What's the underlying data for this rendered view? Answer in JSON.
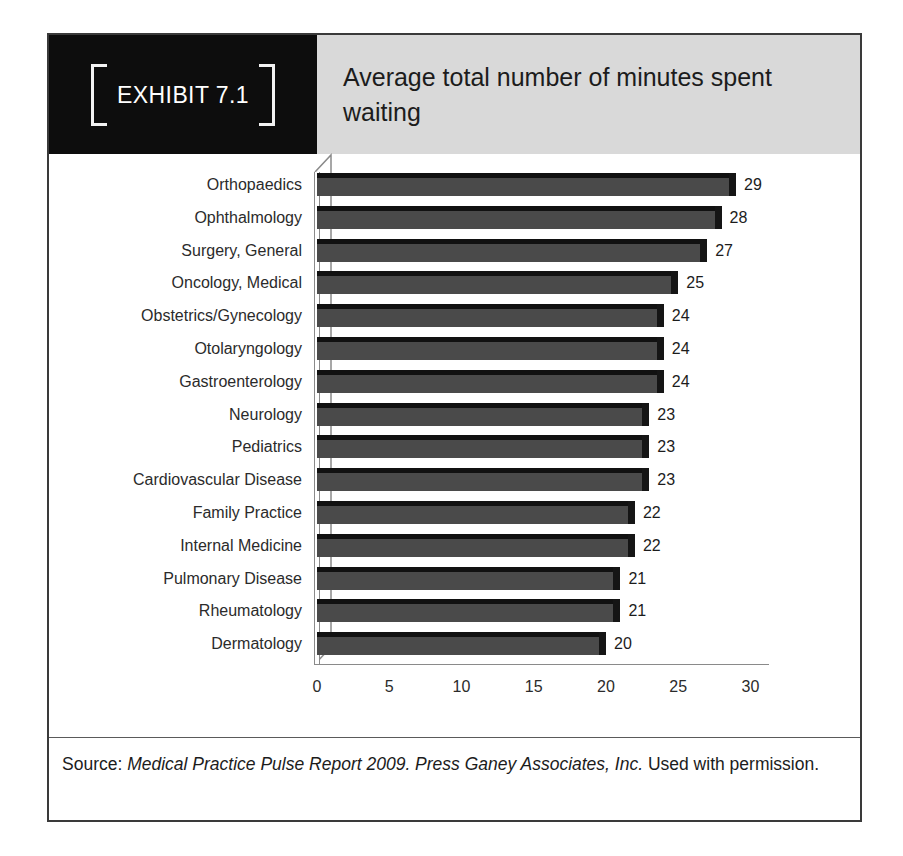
{
  "exhibit": {
    "badge_label": "EXHIBIT 7.1",
    "title": "Average total number of minutes spent waiting",
    "source_prefix": "Source: ",
    "source_italic": "Medical Practice Pulse Report 2009. Press Ganey Associates, Inc.",
    "source_suffix": " Used with permission.",
    "frame_color": "#3a3a3a",
    "badge_background": "#0d0d0d",
    "title_background": "#d9d9d9"
  },
  "chart_data": {
    "type": "bar",
    "orientation": "horizontal",
    "title": "Average total number of minutes spent waiting",
    "xlabel": "",
    "ylabel": "",
    "xlim": [
      0,
      30
    ],
    "xticks": [
      0,
      5,
      10,
      15,
      20,
      25,
      30
    ],
    "xtick_labels": [
      "0",
      "5",
      "10",
      "15",
      "20",
      "25",
      "30"
    ],
    "grid": false,
    "legend": false,
    "bar_color": "#4a4a4a",
    "bar_shade_color": "#111111",
    "data_labels": true,
    "style": "3d-bar",
    "categories": [
      "Orthopaedics",
      "Ophthalmology",
      "Surgery, General",
      "Oncology, Medical",
      "Obstetrics/Gynecology",
      "Otolaryngology",
      "Gastroenterology",
      "Neurology",
      "Pediatrics",
      "Cardiovascular Disease",
      "Family Practice",
      "Internal Medicine",
      "Pulmonary Disease",
      "Rheumatology",
      "Dermatology"
    ],
    "values": [
      29,
      28,
      27,
      25,
      24,
      24,
      24,
      23,
      23,
      23,
      22,
      22,
      21,
      21,
      20
    ],
    "value_labels": [
      "29",
      "28",
      "27",
      "25",
      "24",
      "24",
      "24",
      "23",
      "23",
      "23",
      "22",
      "22",
      "21",
      "21",
      "20"
    ]
  }
}
